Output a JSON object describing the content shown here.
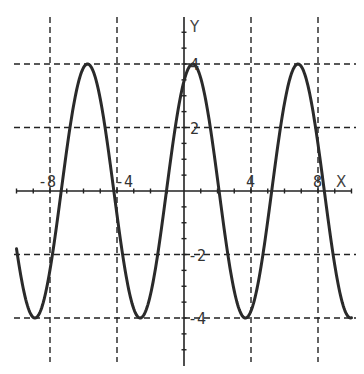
{
  "chart_data": {
    "type": "line",
    "title": "",
    "xlabel": "X",
    "ylabel": "Y",
    "function": "y = 4 sin(x + π/3)",
    "xlim": [
      -10,
      10
    ],
    "ylim": [
      -5.4,
      5.5
    ],
    "grid": true,
    "grid_style": "dashed",
    "x_gridlines": [
      -8,
      -4,
      4,
      8
    ],
    "y_gridlines": [
      4,
      2,
      -2,
      -4
    ],
    "x_tick_step": 1,
    "y_tick_step": 0.5,
    "x_tick_labels": [
      "-8",
      "-4",
      "4",
      "8"
    ],
    "y_tick_labels": [
      "4",
      "2",
      "-2",
      "-4"
    ],
    "series": [
      {
        "name": "y = 4 sin(x + π/3)",
        "amplitude": 4,
        "period": 6.283,
        "phase_shift": 1.047,
        "x": [
          -10,
          -9,
          -8,
          -7,
          -6.28,
          -5.76,
          -5,
          -4.19,
          -4,
          -3,
          -2.62,
          -2,
          -1.05,
          0,
          0.52,
          1,
          2,
          2.09,
          3,
          3.67,
          4,
          5,
          5.24,
          6,
          6.81,
          7,
          8,
          8.38,
          9,
          9.95,
          10
        ],
        "y": [
          -1.83,
          -3.47,
          -3.91,
          -1.54,
          3.46,
          4.0,
          2.87,
          0.0,
          -0.82,
          -3.79,
          -4.0,
          -3.26,
          0.0,
          3.46,
          4.0,
          3.83,
          0.32,
          0.0,
          -3.47,
          -4.0,
          -3.91,
          -1.54,
          0.0,
          2.87,
          4.0,
          3.93,
          0.73,
          0.0,
          -2.61,
          -4.0,
          -4.0
        ]
      }
    ],
    "key_points": {
      "maxima": [
        [
          -5.76,
          4
        ],
        [
          0.52,
          4
        ],
        [
          6.81,
          4
        ]
      ],
      "minima": [
        [
          -8.9,
          -4
        ],
        [
          -2.62,
          -4
        ],
        [
          3.67,
          -4
        ],
        [
          9.95,
          -4
        ]
      ]
    }
  },
  "labels": {
    "x_axis": "X",
    "y_axis": "Y",
    "x_ticks": [
      "-8",
      "-4",
      "4",
      "8"
    ],
    "y_ticks": [
      "4",
      "2",
      "-2",
      "-4"
    ]
  }
}
